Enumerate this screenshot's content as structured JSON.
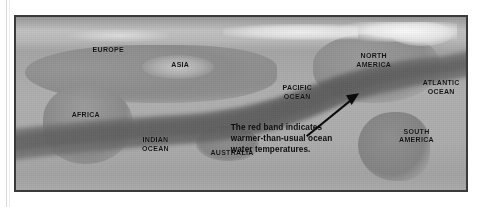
{
  "figure": {
    "kind": "map",
    "title_visible": false,
    "frame_color": "#3a3a3a",
    "background_color": "#a9a9a9"
  },
  "map": {
    "projection_note": "world-map-equirectangular",
    "labels": [
      {
        "name": "europe",
        "text": "EUROPE",
        "x": 20.5,
        "y": 19.0
      },
      {
        "name": "asia",
        "text": "ASIA",
        "x": 36.5,
        "y": 27.5
      },
      {
        "name": "africa",
        "text": "AFRICA",
        "x": 15.5,
        "y": 56.5
      },
      {
        "name": "indian-ocean",
        "text": "INDIAN\nOCEAN",
        "x": 31.0,
        "y": 73.5
      },
      {
        "name": "australia",
        "text": "AUSTRALIA",
        "x": 48.0,
        "y": 78.5
      },
      {
        "name": "pacific-ocean",
        "text": "PACIFIC\nOCEAN",
        "x": 62.5,
        "y": 43.5
      },
      {
        "name": "north-america",
        "text": "NORTH\nAMERICA",
        "x": 79.5,
        "y": 25.0
      },
      {
        "name": "atlantic-ocean",
        "text": "ATLANTIC\nOCEAN",
        "x": 94.5,
        "y": 40.5
      },
      {
        "name": "south-america",
        "text": "SOUTH\nAMERICA",
        "x": 89.0,
        "y": 68.5
      }
    ],
    "band": {
      "name": "warm-water-band",
      "legend_color_name": "red",
      "rendered_color": "#6e6e6e",
      "description": "wide band sweeping from the Atlantic off Africa eastward across the Indian and Pacific Oceans and up to the eastern Pacific off North America"
    },
    "callout": {
      "text": "The red band indicates\nwarmer-than-usual ocean\nwater temperatures.",
      "x": 59.0,
      "y": 70.0,
      "arrow": {
        "name": "callout-arrow",
        "from_x": 64.5,
        "from_y": 69.0,
        "to_x": 75.5,
        "to_y": 45.5
      }
    }
  }
}
